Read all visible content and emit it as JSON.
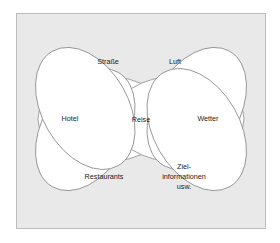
{
  "figure": {
    "type": "venn-rosette-diagram",
    "background_color": "#ffffff",
    "panel_color": "#e9e9e9",
    "panel_border_color": "#bdbdbd",
    "ellipse_stroke_color": "#8a8a8a",
    "ellipse_fill_color": "#ffffff",
    "text_color": "#1a1a1a"
  },
  "center": {
    "label": "Reise"
  },
  "petals": [
    {
      "id": "strasse",
      "label": "Straße",
      "position": "upper-left",
      "angle_deg": -60
    },
    {
      "id": "luft",
      "label": "Luft",
      "position": "upper-right",
      "angle_deg": -120
    },
    {
      "id": "hotel",
      "label": "Hotel",
      "position": "left",
      "angle_deg": 0
    },
    {
      "id": "wetter",
      "label": "Wetter",
      "position": "right",
      "angle_deg": 180
    },
    {
      "id": "restaurants",
      "label": "Restaurants",
      "position": "lower-left",
      "angle_deg": 60
    },
    {
      "id": "zielinformationen",
      "label": "Ziel-informationen usw.",
      "label_lines": [
        "Ziel-",
        "informationen",
        "usw."
      ],
      "position": "lower-right",
      "angle_deg": 120
    }
  ]
}
